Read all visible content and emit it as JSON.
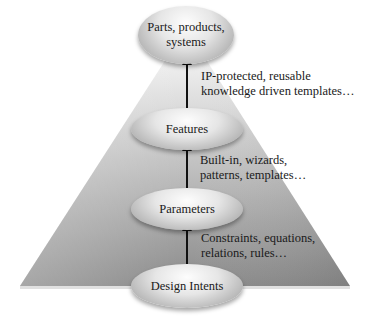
{
  "diagram": {
    "type": "pyramid",
    "levels": [
      {
        "id": "parts",
        "label": "Parts, products, systems",
        "line1": "Parts, products,",
        "line2": "systems"
      },
      {
        "id": "features",
        "label": "Features"
      },
      {
        "id": "parameters",
        "label": "Parameters"
      },
      {
        "id": "design-intents",
        "label": "Design Intents"
      }
    ],
    "connectors": [
      {
        "from": "features",
        "to": "parts",
        "line1": "IP-protected, reusable",
        "line2": "knowledge driven templates…"
      },
      {
        "from": "parameters",
        "to": "features",
        "line1": "Built-in, wizards,",
        "line2": "patterns, templates…"
      },
      {
        "from": "design-intents",
        "to": "parameters",
        "line1": "Constraints, equations,",
        "line2": "relations, rules…"
      }
    ],
    "colors": {
      "pyramid_top": "#f4f4f4",
      "pyramid_bottom": "#8a8a8a",
      "node_highlight": "#fdfdfd",
      "node_shadow": "#8e8e8e",
      "arrow": "#111111"
    }
  }
}
